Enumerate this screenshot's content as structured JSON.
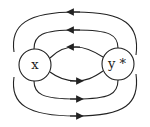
{
  "diagram": {
    "nodes": [
      {
        "id": "x",
        "label": "x",
        "cx": 35,
        "cy": 65,
        "r": 16
      },
      {
        "id": "y_star",
        "label": "y *",
        "cx": 118,
        "cy": 64,
        "r": 16
      }
    ],
    "edges": [
      {
        "from": "y_star",
        "to": "x",
        "position": "top-outer",
        "direction": "left"
      },
      {
        "from": "y_star",
        "to": "x",
        "position": "top-middle",
        "direction": "left"
      },
      {
        "from": "y_star",
        "to": "x",
        "position": "top-inner",
        "direction": "left"
      },
      {
        "from": "x",
        "to": "y_star",
        "position": "bottom-inner",
        "direction": "right"
      },
      {
        "from": "x",
        "to": "y_star",
        "position": "bottom-middle",
        "direction": "right"
      },
      {
        "from": "x",
        "to": "y_star",
        "position": "bottom-outer",
        "direction": "right"
      }
    ],
    "colors": {
      "stroke": "#222222",
      "background": "#ffffff"
    }
  }
}
